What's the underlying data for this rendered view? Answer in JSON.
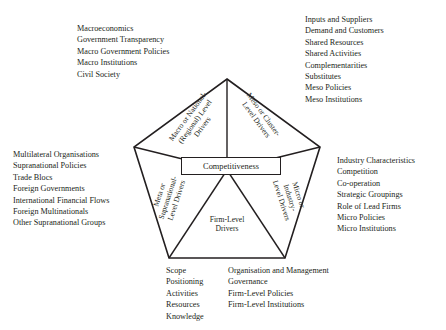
{
  "diagram": {
    "title_box": "Competitiveness",
    "sectors": [
      {
        "key": "macro",
        "lines": [
          "Macro or National-",
          "(Regional) Level",
          "Drivers"
        ]
      },
      {
        "key": "meso",
        "lines": [
          "Meso or Cluster-",
          "Level Drivers"
        ]
      },
      {
        "key": "meta",
        "lines": [
          "Meta or",
          "Supranational-",
          "Level Drivers"
        ]
      },
      {
        "key": "micro",
        "lines": [
          "Micro or",
          "Industry-",
          "Level Drivers"
        ]
      },
      {
        "key": "firm",
        "lines": [
          "Firm-Level",
          "Drivers"
        ]
      }
    ],
    "geometry": {
      "stroke": "#231f20",
      "fill": "#ffffff",
      "vertices": "227,79 320,147 285,258 169,258 134,147",
      "center": "227,170"
    }
  },
  "lists": {
    "macro": [
      "Macroeconomics",
      "Government Transparency",
      "Macro Government Policies",
      "Macro Institutions",
      "Civil Society"
    ],
    "meso": [
      "Inputs and Suppliers",
      "Demand and Customers",
      "Shared Resources",
      "Shared Activities",
      "Complementarities",
      "Substitutes",
      "Meso Policies",
      "Meso Institutions"
    ],
    "meta": [
      "Multilateral Organisations",
      "Supranational Policies",
      "Trade Blocs",
      "Foreign Governments",
      "International Financial Flows",
      "Foreign Multinationals",
      "Other Supranational Groups"
    ],
    "micro": [
      "Industry Characteristics",
      "Competition",
      "Co-operation",
      "Strategic Groupings",
      "Role of Lead Firms",
      "Micro Policies",
      "Micro Institutions"
    ],
    "firm_left": [
      "Scope",
      "Positioning",
      "Activities",
      "Resources",
      "Knowledge"
    ],
    "firm_right": [
      "Organisation and Management",
      "Governance",
      "Firm-Level Policies",
      "Firm-Level Institutions"
    ]
  }
}
